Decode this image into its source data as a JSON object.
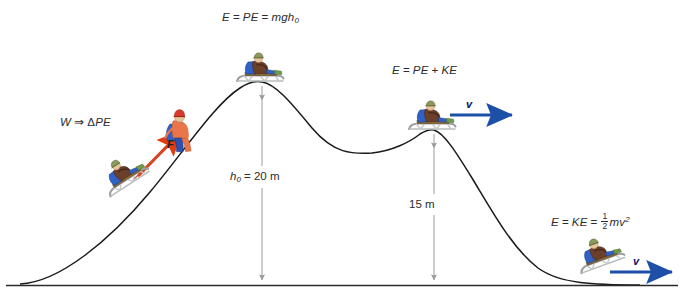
{
  "figure": {
    "background_color": "#ffffff",
    "width": 684,
    "height": 298
  },
  "colors": {
    "curve": "#1a1a1a",
    "ground": "#2a2a2a",
    "dimension_line": "#9a9a9a",
    "velocity_arrow": "#1b4fa8",
    "force_arrow": "#e23a12",
    "text": "#2b2b2b",
    "sled_metal": "#b9bcbd",
    "cape_blue": "#2f62c4",
    "jacket_orange": "#e8764a",
    "cap_red": "#d8392a",
    "helmet_olive": "#8a9a5b",
    "body_brown": "#6b3f2a",
    "boot_green": "#6f9a4a"
  },
  "labels": {
    "work": {
      "text": "W ⇒ ΔPE",
      "parts": {
        "w": "W",
        "arrow": "⇒",
        "delta": "Δ",
        "pe": "PE"
      },
      "x": 60,
      "y": 122
    },
    "top_energy": {
      "text": "E = PE = mgh0",
      "parts": {
        "e": "E",
        "eq1": "=",
        "pe": "PE",
        "eq2": "=",
        "mgh": "mgh",
        "sub": "0"
      },
      "x": 222,
      "y": 11
    },
    "mid_energy": {
      "text": "E = PE + KE",
      "parts": {
        "e": "E",
        "eq": "=",
        "pe": "PE",
        "plus": "+",
        "ke": "KE"
      },
      "x": 392,
      "y": 65
    },
    "kinetic_energy": {
      "text": "E = KE = 1/2 mv2",
      "parts": {
        "e": "E",
        "eq1": "=",
        "ke": "KE",
        "eq2": "=",
        "num": "1",
        "den": "2",
        "mv": "mv",
        "sup": "2"
      },
      "x": 551,
      "y": 213
    },
    "force": {
      "text": "F",
      "x": 167,
      "y": 144
    },
    "velocity_mid": {
      "text": "v",
      "x": 465,
      "y": 101
    },
    "velocity_bottom": {
      "text": "v",
      "x": 632,
      "y": 258
    }
  },
  "dimensions": [
    {
      "name": "h0",
      "label_html": "h0 = 20 m",
      "label_var": "h",
      "label_sub": "0",
      "label_rest": " = 20 m",
      "value": 20,
      "unit": "m",
      "label_x": 230,
      "label_y": 172,
      "line_x": 262,
      "line_top": 84,
      "line_bottom": 285
    },
    {
      "name": "h1",
      "label_html": "15 m",
      "label_var": "",
      "label_sub": "",
      "label_rest": "15 m",
      "value": 15,
      "unit": "m",
      "label_x": 409,
      "label_y": 199,
      "line_x": 434,
      "line_top": 132,
      "line_bottom": 285
    }
  ],
  "hill": {
    "ground_y": 285,
    "ground_x_start": 6,
    "ground_x_end": 678,
    "peak1": {
      "x": 262,
      "y": 82,
      "height_m": 20
    },
    "valley": {
      "x": 372,
      "y": 153
    },
    "peak2": {
      "x": 434,
      "y": 130,
      "height_m": 15
    },
    "curve_start": {
      "x": 20,
      "y": 284
    },
    "curve_end": {
      "x": 640,
      "y": 285
    }
  },
  "sledders": [
    {
      "name": "pulled-sledder",
      "position": "lower left slope",
      "x": 108,
      "y": 168,
      "rotation": -32,
      "has_velocity_arrow": false
    },
    {
      "name": "hilltop-sledder",
      "position": "first peak",
      "x": 262,
      "y": 62,
      "rotation": 0,
      "has_velocity_arrow": false
    },
    {
      "name": "second-peak-sledder",
      "position": "second peak",
      "x": 434,
      "y": 110,
      "rotation": 0,
      "has_velocity_arrow": true
    },
    {
      "name": "bottom-sledder",
      "position": "bottom of final slope",
      "x": 598,
      "y": 258,
      "rotation": -22,
      "has_velocity_arrow": true
    }
  ],
  "standing_figure": {
    "name": "pulling-skier",
    "x": 163,
    "y": 132,
    "pulls": "rope to sled"
  },
  "arrows": {
    "velocity_mid": {
      "x1": 450,
      "y1": 115,
      "x2": 515,
      "y2": 115
    },
    "velocity_bottom": {
      "x1": 612,
      "y1": 272,
      "x2": 676,
      "y2": 272
    },
    "force": {
      "x1": 143,
      "y1": 167,
      "x2": 181,
      "y2": 131
    }
  }
}
